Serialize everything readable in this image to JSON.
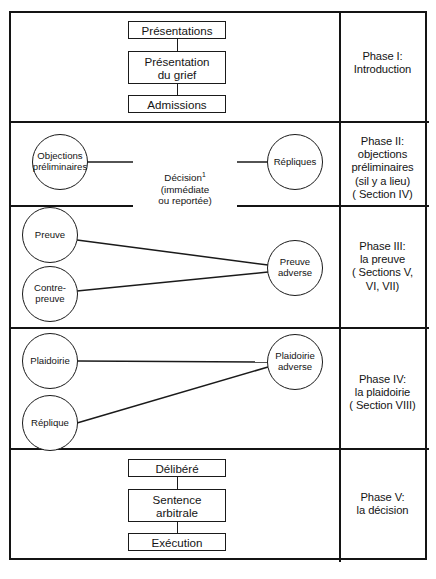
{
  "figure": {
    "kind": "flowchart-table",
    "language": "fr",
    "line_color": "#1a1a1a",
    "background": "#ffffff"
  },
  "phases": [
    {
      "id": "phase-1",
      "label": "Phase I:\nIntroduction",
      "nodes": [
        {
          "id": "presentations",
          "shape": "rect",
          "text": "Présentations"
        },
        {
          "id": "presentation-du-grief",
          "shape": "rect",
          "text": "Présentation\ndu grief"
        },
        {
          "id": "admissions",
          "shape": "rect",
          "text": "Admissions"
        }
      ]
    },
    {
      "id": "phase-2",
      "label": "Phase II:\nobjections\npréliminaires\n(sil y a lieu)\n( Section IV)",
      "nodes": [
        {
          "id": "objections-preliminaires",
          "shape": "circle",
          "text": "Objections\npréliminaires"
        },
        {
          "id": "repliques",
          "shape": "circle",
          "text": "Répliques"
        }
      ],
      "caption": {
        "id": "decision-caption",
        "text": "Décision",
        "marker": "1",
        "detail": "(immédiate\nou reportée)"
      }
    },
    {
      "id": "phase-3",
      "label": "Phase III:\nla preuve\n( Sections V,\nVI, VII)",
      "nodes": [
        {
          "id": "preuve",
          "shape": "circle",
          "text": "Preuve"
        },
        {
          "id": "contre-preuve",
          "shape": "circle",
          "text": "Contre-\npreuve"
        },
        {
          "id": "preuve-adverse",
          "shape": "circle",
          "text": "Preuve\nadverse"
        }
      ]
    },
    {
      "id": "phase-4",
      "label": "Phase IV:\nla plaidoirie\n( Section VIII)",
      "nodes": [
        {
          "id": "plaidoirie",
          "shape": "circle",
          "text": "Plaidoirie"
        },
        {
          "id": "replique",
          "shape": "circle",
          "text": "Réplique"
        },
        {
          "id": "plaidoirie-adverse",
          "shape": "circle",
          "text": "Plaidoirie\nadverse"
        }
      ]
    },
    {
      "id": "phase-5",
      "label": "Phase V:\nla décision",
      "nodes": [
        {
          "id": "delibere",
          "shape": "rect",
          "text": "Délibéré"
        },
        {
          "id": "sentence-arbitrale",
          "shape": "rect",
          "text": "Sentence\narbitrale"
        },
        {
          "id": "execution",
          "shape": "rect",
          "text": "Exécution"
        }
      ]
    }
  ],
  "footnote": {
    "text": ""
  }
}
